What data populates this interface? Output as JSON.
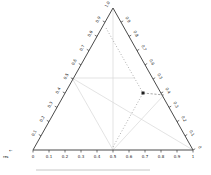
{
  "figure": {
    "background": "#ffffff"
  },
  "chart_data": {
    "type": "scatter",
    "subtype": "ternary",
    "title": "",
    "axes": {
      "bottom": {
        "label": "res",
        "tick_labels": [
          "0",
          "0.1",
          "0.2",
          "0.3",
          "0.4",
          "0.5",
          "0.6",
          "0.7",
          "0.8",
          "0.9",
          "1"
        ],
        "range": [
          0,
          1
        ]
      },
      "left": {
        "tick_labels": [
          "0.1",
          "0.2",
          "0.3",
          "0.4",
          "0.5",
          "0.6",
          "0.7",
          "0.8",
          "0.9"
        ],
        "apex_label": "1.0",
        "range": [
          0,
          1
        ]
      },
      "right": {
        "tick_labels": [
          "0",
          "0.1",
          "0.2",
          "0.3",
          "0.4",
          "0.5",
          "0.6",
          "0.7",
          "0.8",
          "0.9"
        ],
        "range": [
          0,
          1
        ]
      }
    },
    "corner_label": "res",
    "corner_arrow": "←",
    "points": [
      {
        "composition": [
          0.11,
          0.49,
          0.4
        ],
        "px": [
          143,
          93
        ]
      }
    ],
    "layout": {
      "vertices": {
        "bottom_left": [
          33,
          150
        ],
        "bottom_right": [
          193,
          150
        ],
        "top": [
          113,
          8
        ]
      },
      "gridlines_px": [
        [
          [
            72,
            78
          ],
          [
            135,
            78
          ]
        ],
        [
          [
            113,
            8
          ],
          [
            113,
            150
          ]
        ],
        [
          [
            72,
            78
          ],
          [
            113,
            150
          ]
        ],
        [
          [
            72,
            78
          ],
          [
            193,
            150
          ]
        ],
        [
          [
            113,
            150
          ],
          [
            163,
            96
          ]
        ]
      ],
      "guides_px": [
        [
          [
            106,
            28
          ],
          [
            143,
            93
          ]
        ],
        [
          [
            113,
            147
          ],
          [
            143,
            93
          ]
        ],
        [
          [
            143,
            93
          ],
          [
            164,
            95
          ]
        ]
      ],
      "guide_styles": [
        "dot",
        "dot",
        "dash"
      ],
      "frame_line_px": [
        [
          36,
          170
        ],
        [
          150,
          170
        ]
      ],
      "grid_on": true,
      "legend": "none"
    },
    "colors": {
      "outline": "#4a4a4a",
      "tick": "#3a3a3a",
      "grid": "#d7d7d7",
      "guide": "#8f8f8f",
      "point": "#1f1f1f",
      "frame": "#c0c0c0",
      "text": "#222222"
    }
  }
}
